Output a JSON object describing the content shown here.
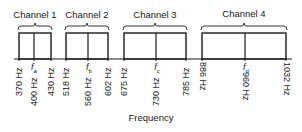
{
  "diagram": {
    "axis_label": "Frequency",
    "colors": {
      "stroke": "#1a1a1a",
      "background": "#ffffff"
    },
    "baseline_y": 59,
    "box_top_y": 33,
    "axis_x_range": [
      14,
      292
    ],
    "channels": [
      {
        "label": "Channel 1",
        "low": "370 Hz",
        "center": "400 Hz",
        "high": "430 Hz",
        "center_symbol": "f",
        "center_sub": "a",
        "x_low": 19,
        "x_center": 34,
        "x_high": 51
      },
      {
        "label": "Channel 2",
        "low": "518 Hz",
        "center": "560 Hz",
        "high": "602 Hz",
        "center_symbol": "f",
        "center_sub": "b",
        "x_low": 66,
        "x_center": 88,
        "x_high": 108
      },
      {
        "label": "Channel 3",
        "low": "675 Hz",
        "center": "730 Hz",
        "high": "785 Hz",
        "center_symbol": "f",
        "center_sub": "c",
        "x_low": 124,
        "x_center": 156,
        "x_high": 186
      },
      {
        "label": "Channel 4",
        "low": "886 Hz",
        "center": "960 Hz",
        "high": "1032 Hz",
        "center_symbol": "f",
        "center_sub": "d",
        "x_low": 202,
        "x_center": 245,
        "x_high": 286
      }
    ]
  }
}
